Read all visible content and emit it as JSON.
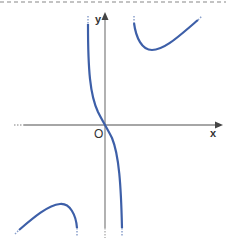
{
  "diagram": {
    "type": "function-graph",
    "axes": {
      "x_label": "x",
      "y_label": "y",
      "origin_label": "O",
      "axis_color": "#888888"
    },
    "curve_color": "#3d5fa8",
    "branches": [
      {
        "name": "middle-branch",
        "description": "decreasing through origin, from +inf near left asymptote to -inf near right asymptote"
      },
      {
        "name": "upper-right-branch",
        "description": "local minimum in first quadrant, rising to upper right"
      },
      {
        "name": "lower-left-branch",
        "description": "local maximum in third quadrant, falling toward bottom"
      }
    ],
    "border": {
      "style": "dashed",
      "color": "#888888"
    }
  }
}
